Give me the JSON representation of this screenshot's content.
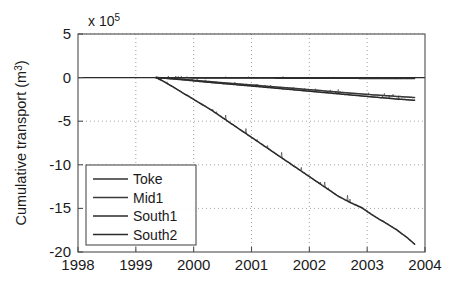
{
  "chart_data": {
    "type": "line",
    "title": "",
    "xlabel": "",
    "ylabel": "Cumulative transport (m3)",
    "ylabel_base": "Cumulative transport (m",
    "ylabel_sup": "3",
    "ylabel_close": ")",
    "y_exponent_prefix": "x 10",
    "y_exponent_power": "5",
    "y_scale_factor": 100000,
    "xlim": [
      1998,
      2004
    ],
    "ylim": [
      -20,
      5
    ],
    "xticks": [
      1998,
      1999,
      2000,
      2001,
      2002,
      2003,
      2004
    ],
    "xtick_labels": [
      "1998",
      "1999",
      "2000",
      "2001",
      "2002",
      "2003",
      "2004"
    ],
    "yticks": [
      5,
      0,
      -5,
      -10,
      -15,
      -20
    ],
    "ytick_labels": [
      "5",
      "0",
      "-5",
      "-10",
      "-15",
      "-20"
    ],
    "grid": true,
    "grid_style": "dotted",
    "legend_position": "lower-left",
    "data_start_x": 1999.35,
    "data_end_x": 2003.82,
    "series": [
      {
        "name": "Toke",
        "color": "#303030",
        "x": [
          1999.35,
          1999.6,
          1999.9,
          2000.2,
          2000.5,
          2000.8,
          2001.1,
          2001.4,
          2001.7,
          2002.0,
          2002.3,
          2002.6,
          2002.9,
          2003.2,
          2003.5,
          2003.82
        ],
        "values": [
          0.0,
          -0.02,
          -0.03,
          -0.04,
          -0.05,
          -0.05,
          -0.06,
          -0.06,
          -0.07,
          -0.07,
          -0.08,
          -0.08,
          -0.09,
          -0.09,
          -0.1,
          -0.1
        ]
      },
      {
        "name": "Mid1",
        "color": "#3a3a3a",
        "x": [
          1999.35,
          1999.6,
          1999.9,
          2000.2,
          2000.5,
          2000.8,
          2001.1,
          2001.4,
          2001.7,
          2002.0,
          2002.3,
          2002.6,
          2002.9,
          2003.2,
          2003.5,
          2003.82
        ],
        "values": [
          0.0,
          -0.1,
          -0.25,
          -0.42,
          -0.58,
          -0.74,
          -0.9,
          -1.06,
          -1.22,
          -1.38,
          -1.55,
          -1.72,
          -1.88,
          -2.02,
          -2.15,
          -2.28
        ]
      },
      {
        "name": "South1",
        "color": "#2b2b2b",
        "x": [
          1999.35,
          1999.6,
          1999.9,
          2000.2,
          2000.5,
          2000.8,
          2001.1,
          2001.4,
          2001.7,
          2002.0,
          2002.3,
          2002.6,
          2002.9,
          2003.2,
          2003.5,
          2003.82
        ],
        "values": [
          0.0,
          -0.12,
          -0.3,
          -0.5,
          -0.68,
          -0.85,
          -1.02,
          -1.2,
          -1.38,
          -1.56,
          -1.74,
          -1.92,
          -2.1,
          -2.28,
          -2.45,
          -2.6
        ]
      },
      {
        "name": "South2",
        "color": "#2b2b2b",
        "x": [
          1999.35,
          1999.5,
          1999.7,
          1999.9,
          2000.1,
          2000.3,
          2000.5,
          2000.7,
          2000.9,
          2001.1,
          2001.3,
          2001.5,
          2001.7,
          2001.9,
          2002.1,
          2002.3,
          2002.5,
          2002.7,
          2002.9,
          2003.1,
          2003.3,
          2003.5,
          2003.7,
          2003.82
        ],
        "values": [
          0.0,
          -0.5,
          -1.3,
          -2.1,
          -2.9,
          -3.7,
          -4.6,
          -5.5,
          -6.4,
          -7.3,
          -8.2,
          -9.1,
          -10.0,
          -10.9,
          -11.8,
          -12.7,
          -13.6,
          -14.3,
          -14.9,
          -15.8,
          -16.6,
          -17.4,
          -18.4,
          -19.1
        ]
      }
    ]
  },
  "legend": {
    "entries": [
      {
        "label": "Toke"
      },
      {
        "label": "Mid1"
      },
      {
        "label": "South1"
      },
      {
        "label": "South2"
      }
    ]
  }
}
